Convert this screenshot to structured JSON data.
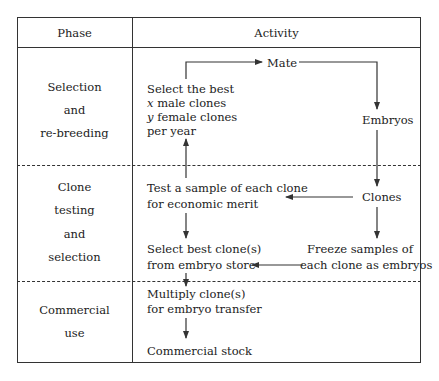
{
  "header": {
    "phase": "Phase",
    "activity": "Activity"
  },
  "phases": [
    {
      "lines": [
        "Selection",
        "and",
        "re-breeding"
      ]
    },
    {
      "lines": [
        "Clone",
        "testing",
        "and",
        "selection"
      ]
    },
    {
      "lines": [
        "Commercial",
        "use"
      ]
    }
  ],
  "activity": {
    "select_best_x_y": {
      "line1": "Select the best",
      "line2_var": "x",
      "line2": " male clones",
      "line3_var": "y",
      "line3": " female clones",
      "line4": "per year"
    },
    "mate": "Mate",
    "embryos": "Embryos",
    "clones": "Clones",
    "test_sample": [
      "Test a sample of each clone",
      "for economic merit"
    ],
    "select_best_clones": [
      "Select best clone(s)",
      "from embryo store"
    ],
    "freeze": [
      "Freeze samples of",
      "each clone as embryos"
    ],
    "multiply": [
      "Multiply clone(s)",
      "for embryo transfer"
    ],
    "commercial_stock": "Commercial stock"
  },
  "colors": {
    "line": "#333333",
    "text": "#222222",
    "background": "#ffffff"
  }
}
